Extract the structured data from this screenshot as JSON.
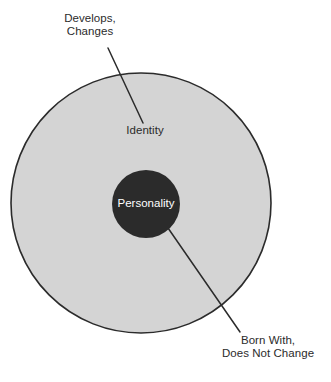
{
  "diagram": {
    "type": "concentric-circles",
    "background_color": "#ffffff",
    "outer_circle": {
      "name": "Identity",
      "label": "Identity",
      "fill_color": "#d4d4d4",
      "stroke_color": "#2b2b2b",
      "center_x": 141,
      "center_y": 203,
      "radius": 130
    },
    "inner_circle": {
      "name": "Personality",
      "label": "Personality",
      "fill_color": "#2b2b2b",
      "text_color": "#ffffff",
      "center_x": 146,
      "center_y": 204,
      "radius": 34
    },
    "annotations": [
      {
        "id": "develops-changes",
        "line_1": "Develops,",
        "line_2": "Changes",
        "points_to": "Identity",
        "leader_from_x": 108,
        "leader_from_y": 48,
        "leader_to_x": 143,
        "leader_to_y": 123
      },
      {
        "id": "born-with",
        "line_1": "Born With,",
        "line_2": "Does Not Change",
        "points_to": "Personality",
        "leader_from_x": 240,
        "leader_from_y": 332,
        "leader_to_x": 168,
        "leader_to_y": 228
      }
    ],
    "leader_line_color": "#2b2b2b",
    "text_color": "#2b2b2b"
  }
}
